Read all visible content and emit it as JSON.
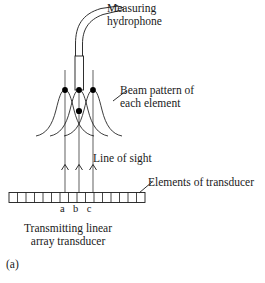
{
  "figure": {
    "panel_label": "(a)",
    "stroke_color": "#1a1a1a",
    "fill_color": "#ffffff",
    "labels": {
      "measuring_hydrophone_line1": "Measuring",
      "measuring_hydrophone_line2": "hydrophone",
      "beam_pattern_line1": "Beam pattern of",
      "beam_pattern_line2": "each element",
      "line_of_sight": "Line of sight",
      "elements_of_transducer": "Elements of transducer",
      "transmitting_line1": "Transmitting linear",
      "transmitting_line2": "array transducer",
      "element_a": "a",
      "element_b": "b",
      "element_c": "c"
    },
    "components": {
      "hydrophone_body": "rectangle-probe",
      "hydrophone_cable": "curved-cable",
      "beam_curves_count": "3",
      "measurement_points_count": "4",
      "ray_arrows_count": "3",
      "transducer_elements_count": "16"
    }
  }
}
